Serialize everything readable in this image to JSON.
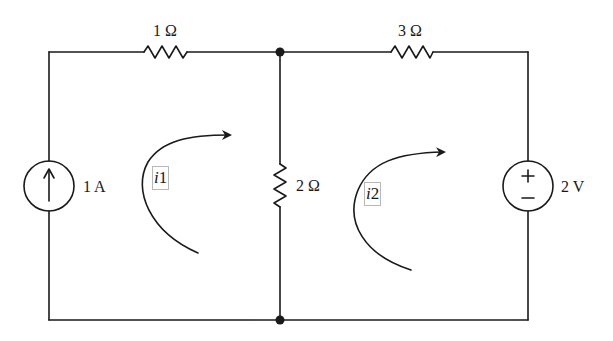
{
  "diagram": {
    "type": "circuit-schematic",
    "colors": {
      "wire": "#1a1a1a",
      "background": "#ffffff",
      "label_box": "#b8b8b8"
    },
    "components": {
      "r1": {
        "label": "1 Ω",
        "value": "1",
        "unit": "Ω",
        "kind": "resistor",
        "position": "top-left branch"
      },
      "r2": {
        "label": "2 Ω",
        "value": "2",
        "unit": "Ω",
        "kind": "resistor",
        "position": "middle vertical branch"
      },
      "r3": {
        "label": "3 Ω",
        "value": "3",
        "unit": "Ω",
        "kind": "resistor",
        "position": "top-right branch"
      },
      "current_source": {
        "label": "1 A",
        "value": "1",
        "unit": "A",
        "kind": "current-source",
        "direction": "up"
      },
      "voltage_source": {
        "label": "2 V",
        "value": "2",
        "unit": "V",
        "kind": "voltage-source",
        "plus_sign": "+",
        "minus_sign": "−"
      }
    },
    "meshes": [
      {
        "id": "i1",
        "symbol": "i",
        "subscript": "1",
        "direction": "clockwise"
      },
      {
        "id": "i2",
        "symbol": "i",
        "subscript": "2",
        "direction": "clockwise"
      }
    ],
    "nodes": [
      {
        "name": "top-middle-junction"
      },
      {
        "name": "bottom-middle-junction"
      }
    ]
  }
}
